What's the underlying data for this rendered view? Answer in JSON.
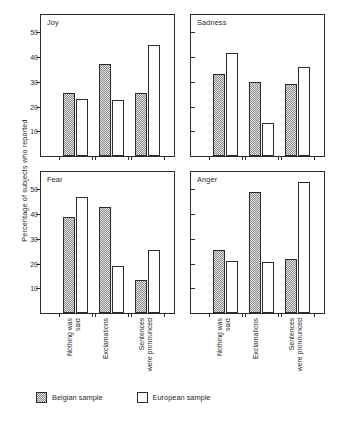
{
  "chart_data": {
    "type": "bar",
    "title": "",
    "xlabel": "",
    "ylabel": "Percentage of subjects who reported",
    "ylim": [
      0,
      57
    ],
    "yticks": [
      10,
      20,
      30,
      40,
      50
    ],
    "grid": false,
    "legend_position": "bottom-left",
    "categories": [
      "Nothing was\nsaid",
      "Exclamations",
      "Sentences\nwere pronounced"
    ],
    "legend": [
      "Belgian sample",
      "European sample"
    ],
    "panels": [
      {
        "title": "Joy",
        "series": [
          {
            "name": "Belgian sample",
            "values": [
              25.5,
              37,
              25.5
            ]
          },
          {
            "name": "European sample",
            "values": [
              23,
              22.5,
              45
            ]
          }
        ]
      },
      {
        "title": "Sadness",
        "series": [
          {
            "name": "Belgian sample",
            "values": [
              33,
              30,
              29
            ]
          },
          {
            "name": "European sample",
            "values": [
              41.5,
              13.5,
              36
            ]
          }
        ]
      },
      {
        "title": "Fear",
        "series": [
          {
            "name": "Belgian sample",
            "values": [
              39,
              43,
              13.5
            ]
          },
          {
            "name": "European sample",
            "values": [
              47,
              19,
              25.5
            ]
          }
        ]
      },
      {
        "title": "Anger",
        "series": [
          {
            "name": "Belgian sample",
            "values": [
              25.5,
              49,
              22
            ]
          },
          {
            "name": "European sample",
            "values": [
              21,
              20.5,
              53
            ]
          }
        ]
      }
    ],
    "colors": {
      "belgian_fill": "#e2e2e2",
      "belgian_hatch": "#8d8d8d",
      "european_fill": "#ffffff",
      "outline": "#2b2b2b"
    }
  }
}
